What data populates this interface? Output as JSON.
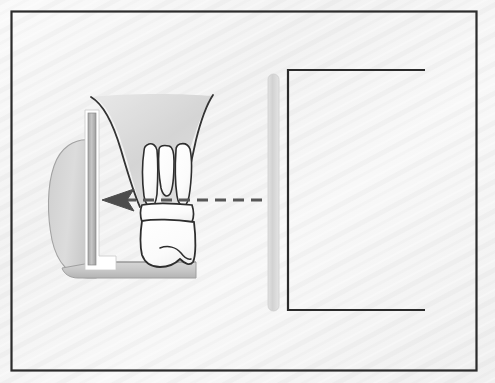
{
  "figure": {
    "domain": "Diagram",
    "title": "Paralleling technique radiographic projection diagram",
    "width": 495,
    "height": 383,
    "background_color": "#f6f6f6",
    "frame": {
      "name": "outer-border",
      "stroke_color": "#2b2b2b",
      "stroke_width": 2,
      "x": 11,
      "y": 11,
      "width": 466,
      "height": 360
    },
    "elements": [
      {
        "id": "tongue",
        "label": "tongue",
        "shape": "rounded-blob",
        "fill_color": "#d2d2d2",
        "stroke_color": "#9a9a9a"
      },
      {
        "id": "film-holder-vertical",
        "label": "intraoral film / sensor plate",
        "shape": "vertical-bar",
        "fill_color": "#b9b9b9",
        "stroke_color": "#ffffff",
        "x": 88,
        "y": 112,
        "width": 9,
        "height": 160
      },
      {
        "id": "bite-block",
        "label": "bite block platform",
        "shape": "horizontal-bar",
        "fill_color": "#c9c9c9",
        "stroke_color": "#9a9a9a"
      },
      {
        "id": "palate-soft-tissue",
        "label": "palatal soft tissue and alveolar bone",
        "fill_color": "#dcdcdc",
        "stroke_color": "#3a3a3a"
      },
      {
        "id": "molar-tooth",
        "label": "maxillary molar with three roots",
        "fill_color": "#fdfdfd",
        "stroke_color": "#2e2e2e",
        "root_count": 3
      },
      {
        "id": "central-ray",
        "label": "central x-ray beam (dashed)",
        "style": "dashed-arrow",
        "color": "#555555",
        "direction": "right-to-left",
        "y": 200,
        "x_start": 262,
        "x_end": 104
      },
      {
        "id": "pid-aperture-bar",
        "label": "position indicating device aperture",
        "shape": "rounded-vertical-bar",
        "fill_color": "#d6d6d6",
        "x": 268,
        "y": 74,
        "width": 11,
        "height": 237
      },
      {
        "id": "tubehead-outline",
        "label": "x-ray tubehead / cone outline (open right)",
        "shape": "open-rectangle",
        "stroke_color": "#2b2b2b",
        "stroke_width": 2,
        "x": 287,
        "y": 70,
        "width": 138,
        "height": 240
      }
    ],
    "captions": [],
    "annotations": []
  }
}
